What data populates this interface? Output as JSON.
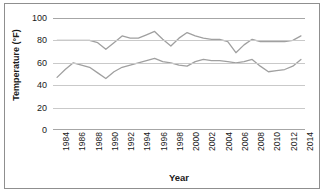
{
  "chart_data": {
    "type": "line",
    "title": "",
    "xlabel": "Year",
    "ylabel": "Temperature (°F)",
    "ylim": [
      0,
      100
    ],
    "yticks": [
      0,
      20,
      40,
      60,
      80,
      100
    ],
    "grid": true,
    "legend": "none",
    "x": [
      1984,
      1985,
      1986,
      1987,
      1988,
      1989,
      1990,
      1991,
      1992,
      1993,
      1994,
      1995,
      1996,
      1997,
      1998,
      1999,
      2000,
      2001,
      2002,
      2003,
      2004,
      2005,
      2006,
      2007,
      2008,
      2009,
      2010,
      2011,
      2012,
      2013,
      2014
    ],
    "xtick_labels": [
      "1984",
      "1986",
      "1988",
      "1990",
      "1992",
      "1994",
      "1996",
      "1998",
      "2000",
      "2002",
      "2004",
      "2006",
      "2008",
      "2010",
      "2012",
      "2014"
    ],
    "series": [
      {
        "name": "High Temperature",
        "color": "#a0a0a0",
        "values": [
          80,
          80,
          80,
          80,
          80,
          78,
          72,
          78,
          84,
          82,
          82,
          85,
          88,
          81,
          75,
          82,
          87,
          84,
          82,
          81,
          81,
          79,
          69,
          76,
          81,
          79,
          79,
          79,
          79,
          80,
          84
        ]
      },
      {
        "name": "Low Temperature",
        "color": "#a0a0a0",
        "values": [
          47,
          54,
          60,
          58,
          56,
          51,
          46,
          52,
          56,
          58,
          60,
          62,
          64,
          61,
          60,
          58,
          57,
          61,
          63,
          62,
          62,
          61,
          60,
          61,
          63,
          57,
          52,
          53,
          54,
          57,
          63
        ]
      }
    ]
  }
}
